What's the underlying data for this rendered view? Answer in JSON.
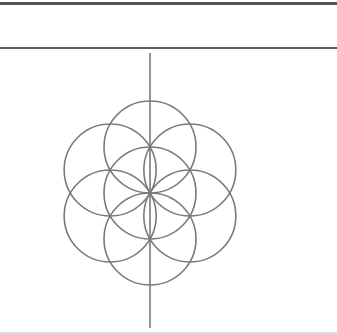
{
  "figure": {
    "title": "",
    "stroke_color": "#7a7a7a",
    "center": [
      150,
      193
    ],
    "radius": 46,
    "circle_count": 7,
    "axis": {
      "x": 150,
      "y1": 53,
      "y2": 328
    }
  }
}
